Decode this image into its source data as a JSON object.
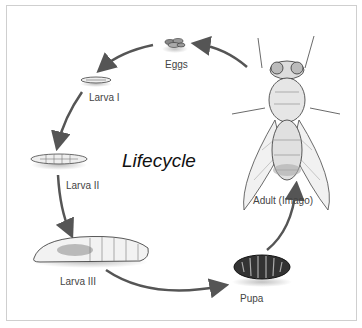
{
  "title": "Lifecycle",
  "stages": [
    {
      "label": "Eggs"
    },
    {
      "label": "Larva I"
    },
    {
      "label": "Larva II"
    },
    {
      "label": "Larva III"
    },
    {
      "label": "Pupa"
    },
    {
      "label": "Adult (Imago)"
    }
  ],
  "colors": {
    "arrow": "#555555",
    "border": "#cfcfcf",
    "text": "#444444"
  }
}
